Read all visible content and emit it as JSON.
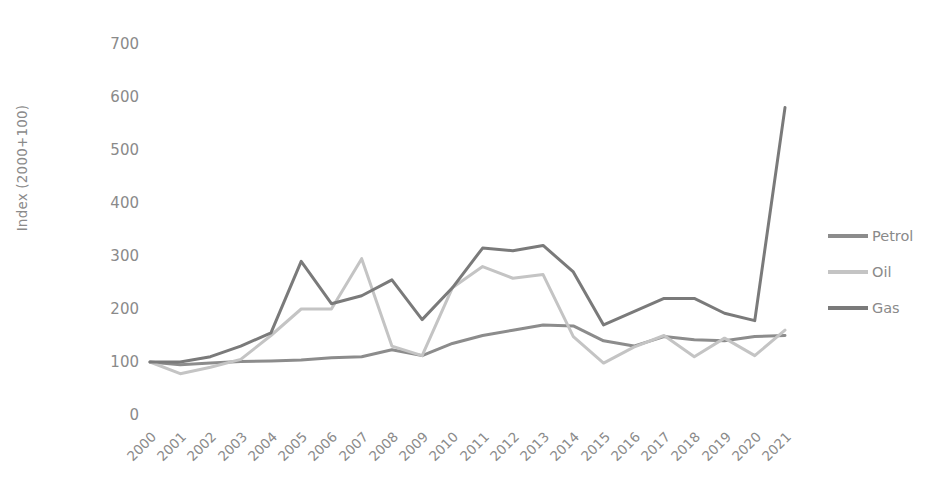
{
  "chart_data": {
    "type": "line",
    "title": "",
    "xlabel": "",
    "ylabel": "Index (2000+100)",
    "grid": false,
    "legend_position": "right",
    "ylim": [
      0,
      700
    ],
    "yticks": [
      0,
      100,
      200,
      300,
      400,
      500,
      600,
      700
    ],
    "categories": [
      "2000",
      "2001",
      "2002",
      "2003",
      "2004",
      "2005",
      "2006",
      "2007",
      "2008",
      "2009",
      "2010",
      "2011",
      "2012",
      "2013",
      "2014",
      "2015",
      "2016",
      "2017",
      "2018",
      "2019",
      "2020",
      "2021"
    ],
    "series": [
      {
        "name": "Petrol",
        "color": "#8c8c8c",
        "values": [
          100,
          95,
          98,
          101,
          102,
          104,
          108,
          110,
          123,
          112,
          135,
          150,
          160,
          170,
          168,
          140,
          130,
          148,
          142,
          140,
          148,
          150
        ]
      },
      {
        "name": "Oil",
        "color": "#c4c4c4",
        "values": [
          100,
          78,
          90,
          105,
          150,
          200,
          200,
          295,
          130,
          112,
          240,
          280,
          258,
          265,
          148,
          98,
          128,
          150,
          110,
          145,
          112,
          160
        ]
      },
      {
        "name": "Gas",
        "color": "#7a7a7a",
        "values": [
          100,
          100,
          110,
          130,
          155,
          290,
          210,
          225,
          255,
          180,
          240,
          315,
          310,
          320,
          270,
          170,
          195,
          220,
          220,
          192,
          178,
          580
        ]
      }
    ]
  },
  "legend": {
    "items": [
      {
        "label": "Petrol",
        "color": "#8c8c8c"
      },
      {
        "label": "Oil",
        "color": "#c4c4c4"
      },
      {
        "label": "Gas",
        "color": "#7a7a7a"
      }
    ]
  }
}
